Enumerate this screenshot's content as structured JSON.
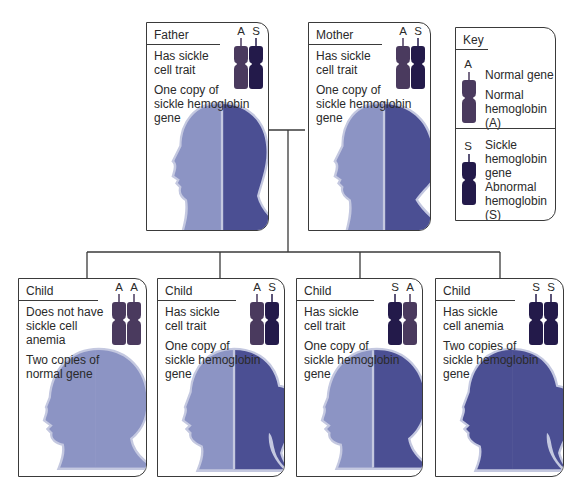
{
  "colors": {
    "normal_chromosome": "#4a3a5e",
    "sickle_chromosome": "#231a4a",
    "normal_head": "#8c94c4",
    "sickle_head": "#4b4f93",
    "halo": "#c4c8e0",
    "line": "#3a3a3a"
  },
  "parents": [
    {
      "title": "Father",
      "alleles": [
        "A",
        "S"
      ],
      "status": "Has sickle\ncell trait",
      "description": "One copy of\nsickle hemoglobin\ngene"
    },
    {
      "title": "Mother",
      "alleles": [
        "A",
        "S"
      ],
      "status": "Has sickle\ncell trait",
      "description": "One copy of\nsickle hemoglobin\ngene"
    }
  ],
  "children": [
    {
      "title": "Child",
      "alleles": [
        "A",
        "A"
      ],
      "status": "Does not have\nsickle cell\nanemia",
      "description": "Two copies of\nnormal gene"
    },
    {
      "title": "Child",
      "alleles": [
        "A",
        "S"
      ],
      "status": "Has sickle\ncell trait",
      "description": "One copy of\nsickle hemoglobin\ngene"
    },
    {
      "title": "Child",
      "alleles": [
        "S",
        "A"
      ],
      "status": "Has sickle\ncell trait",
      "description": "One copy of\nsickle hemoglobin\ngene"
    },
    {
      "title": "Child",
      "alleles": [
        "S",
        "S"
      ],
      "status": "Has sickle\ncell anemia",
      "description": "Two copies of\nsickle hemoglobin\ngene"
    }
  ],
  "key": {
    "title": "Key",
    "normal": {
      "allele": "A",
      "gene_label": "Normal gene",
      "protein_label": "Normal\nhemoglobin\n(A)"
    },
    "sickle": {
      "allele": "S",
      "gene_label": "Sickle\nhemoglobin\ngene",
      "protein_label": "Abnormal\nhemoglobin\n(S)"
    }
  }
}
